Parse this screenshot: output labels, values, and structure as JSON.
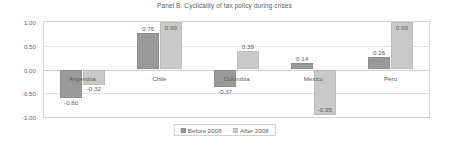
{
  "chart_data": {
    "type": "bar",
    "title": "Panel B. Cyclicality of tax policy during crises",
    "xlabel": "",
    "ylabel": "",
    "ylim": [
      -1.0,
      1.0
    ],
    "ytick_labels": [
      "1.00",
      "0.50",
      "0.00",
      "-0.50",
      "-1.00"
    ],
    "ytick_values": [
      1.0,
      0.5,
      0.0,
      -0.5,
      -1.0
    ],
    "grid": true,
    "legend_position": "bottom-center",
    "categories": [
      "Argentina",
      "Chile",
      "Colombia",
      "Mexico",
      "Peru"
    ],
    "series": [
      {
        "name": "Before 2008",
        "color": "#9a9a9a",
        "values": [
          -0.6,
          0.76,
          -0.37,
          0.14,
          0.26
        ],
        "labels": [
          "-0.60",
          "0.76",
          "-0.37",
          "0.14",
          "0.26"
        ]
      },
      {
        "name": "After 2008",
        "color": "#c9c9c9",
        "values": [
          -0.32,
          0.99,
          0.39,
          -0.95,
          0.99
        ],
        "labels": [
          "-0.32",
          "0.99",
          "0.39",
          "-0.95",
          "0.99"
        ]
      }
    ]
  },
  "legend": {
    "items": [
      {
        "label": "Before 2008"
      },
      {
        "label": "After 2008"
      }
    ]
  }
}
